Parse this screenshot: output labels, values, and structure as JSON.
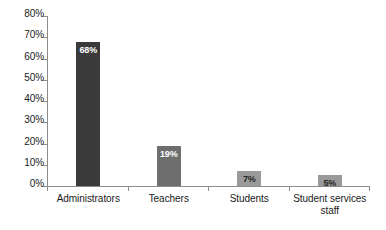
{
  "chart_data": {
    "type": "bar",
    "title": "",
    "subtitle": "",
    "xlabel": "",
    "ylabel": "",
    "ylim": [
      0,
      80
    ],
    "grid": false,
    "legend": null,
    "categories": [
      "Administrators",
      "Teachers",
      "Students",
      "Student services staff"
    ],
    "values": [
      68,
      19,
      7,
      5
    ],
    "data_labels": [
      "68%",
      "19%",
      "7%",
      "5%"
    ],
    "y_ticks": [
      0,
      10,
      20,
      30,
      40,
      50,
      60,
      70,
      80
    ],
    "y_tick_labels": [
      "0%",
      "10%",
      "20%",
      "30%",
      "40%",
      "50%",
      "60%",
      "70%",
      "80%"
    ],
    "bar_colors": [
      "#3a3a3a",
      "#6e6e6e",
      "#9a9a9a",
      "#9a9a9a"
    ],
    "label_colors": [
      "light",
      "light",
      "dark",
      "dark"
    ]
  },
  "axes": {
    "axis_color": "#8c8c8c",
    "background": "#ffffff"
  },
  "categories_display": [
    {
      "lines": [
        "Administrators"
      ]
    },
    {
      "lines": [
        "Teachers"
      ]
    },
    {
      "lines": [
        "Students"
      ]
    },
    {
      "lines": [
        "Student services",
        "staff"
      ]
    }
  ]
}
